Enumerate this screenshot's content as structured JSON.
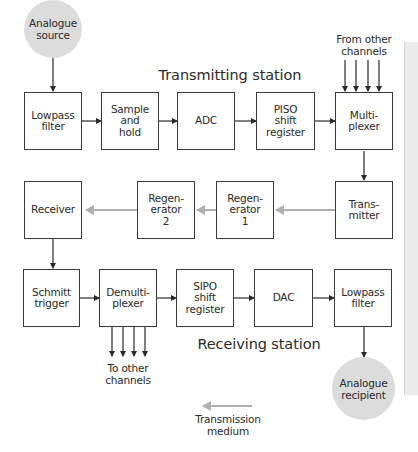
{
  "diagram": {
    "type": "block-diagram",
    "title_transmitting": "Transmitting station",
    "title_receiving": "Receiving station",
    "nodes": {
      "analogue_source": "Analogue\nsource",
      "lowpass_tx": "Lowpass\nfilter",
      "sample_hold": "Sample\nand\nhold",
      "adc": "ADC",
      "piso": "PISO\nshift\nregister",
      "multiplexer": "Multi-\nplexer",
      "transmitter": "Trans-\nmitter",
      "regenerator1": "Regen-\nerator\n1",
      "regenerator2": "Regen-\nerator\n2",
      "receiver": "Receiver",
      "schmitt": "Schmitt\ntrigger",
      "demultiplexer": "Demulti-\nplexer",
      "sipo": "SIPO\nshift\nregister",
      "dac": "DAC",
      "lowpass_rx": "Lowpass\nfilter",
      "analogue_recipient": "Analogue\nrecipient"
    },
    "annotations": {
      "from_other_channels": "From other\nchannels",
      "to_other_channels": "To other\nchannels",
      "transmission_medium": "Transmission\nmedium"
    },
    "edges": [
      {
        "from": "Analogue source",
        "to": "Lowpass filter",
        "style": "signal"
      },
      {
        "from": "Lowpass filter",
        "to": "Sample and hold",
        "style": "signal"
      },
      {
        "from": "Sample and hold",
        "to": "ADC",
        "style": "signal"
      },
      {
        "from": "ADC",
        "to": "PISO shift register",
        "style": "signal"
      },
      {
        "from": "PISO shift register",
        "to": "Multiplexer",
        "style": "signal"
      },
      {
        "from": "Other channels (x4)",
        "to": "Multiplexer",
        "style": "signal"
      },
      {
        "from": "Multiplexer",
        "to": "Transmitter",
        "style": "signal"
      },
      {
        "from": "Transmitter",
        "to": "Regenerator 1",
        "style": "transmission-medium"
      },
      {
        "from": "Regenerator 1",
        "to": "Regenerator 2",
        "style": "transmission-medium"
      },
      {
        "from": "Regenerator 2",
        "to": "Receiver",
        "style": "transmission-medium"
      },
      {
        "from": "Receiver",
        "to": "Schmitt trigger",
        "style": "signal"
      },
      {
        "from": "Schmitt trigger",
        "to": "Demultiplexer",
        "style": "signal"
      },
      {
        "from": "Demultiplexer",
        "to": "Other channels (x4)",
        "style": "signal"
      },
      {
        "from": "Demultiplexer",
        "to": "SIPO shift register",
        "style": "signal"
      },
      {
        "from": "SIPO shift register",
        "to": "DAC",
        "style": "signal"
      },
      {
        "from": "DAC",
        "to": "Lowpass filter",
        "style": "signal"
      },
      {
        "from": "Lowpass filter",
        "to": "Analogue recipient",
        "style": "signal"
      }
    ],
    "colors": {
      "signal_line": "#2a2a2a",
      "medium_line": "#b0b0b0",
      "circle_fill": "#dcdcdc",
      "box_border": "#3a3a3a"
    }
  }
}
